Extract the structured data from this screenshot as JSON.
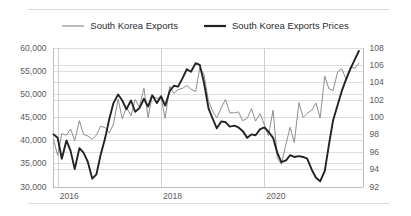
{
  "chart_data": {
    "type": "line",
    "title": "",
    "subtitle": "",
    "xlabel": "",
    "ylabel": "",
    "grid": true,
    "legend_position": "top-center",
    "x_tick_labels": [
      "2016",
      "2018",
      "2020"
    ],
    "x_tick_values": [
      2016,
      2018,
      2020
    ],
    "x_range": [
      2015.9,
      2021.9
    ],
    "axes": [
      {
        "id": "left",
        "side": "left",
        "ylim": [
          30000,
          60000
        ],
        "tick_labels": [
          "60,000",
          "55,000",
          "50,000",
          "45,000",
          "40,000",
          "35,000",
          "30,000"
        ],
        "tick_values": [
          60000,
          55000,
          50000,
          45000,
          40000,
          35000,
          30000
        ]
      },
      {
        "id": "right",
        "side": "right",
        "ylim": [
          92,
          108
        ],
        "tick_labels": [
          "108",
          "106",
          "104",
          "102",
          "100",
          "98",
          "96",
          "94",
          "92"
        ],
        "tick_values": [
          108,
          106,
          104,
          102,
          100,
          98,
          96,
          94,
          92
        ]
      }
    ],
    "series": [
      {
        "name": "South Korea Exports",
        "axis": "left",
        "color": "#8e8e8e",
        "width": 1,
        "x": [
          2015.92,
          2016.0,
          2016.08,
          2016.17,
          2016.25,
          2016.33,
          2016.42,
          2016.5,
          2016.58,
          2016.67,
          2016.75,
          2016.83,
          2016.92,
          2017.0,
          2017.08,
          2017.17,
          2017.25,
          2017.33,
          2017.42,
          2017.5,
          2017.58,
          2017.67,
          2017.75,
          2017.83,
          2017.92,
          2018.0,
          2018.08,
          2018.17,
          2018.25,
          2018.33,
          2018.42,
          2018.5,
          2018.58,
          2018.67,
          2018.75,
          2018.83,
          2018.92,
          2019.0,
          2019.08,
          2019.17,
          2019.25,
          2019.33,
          2019.42,
          2019.5,
          2019.58,
          2019.67,
          2019.75,
          2019.83,
          2019.92,
          2020.0,
          2020.08,
          2020.17,
          2020.25,
          2020.33,
          2020.42,
          2020.5,
          2020.58,
          2020.67,
          2020.75,
          2020.83,
          2020.92,
          2021.0,
          2021.08,
          2021.17,
          2021.25,
          2021.33,
          2021.42,
          2021.5,
          2021.58,
          2021.67,
          2021.75,
          2021.83
        ],
        "values": [
          40100,
          36700,
          41400,
          41100,
          42400,
          39900,
          44200,
          41300,
          40900,
          40200,
          41100,
          43000,
          42700,
          41500,
          43500,
          48900,
          44600,
          47100,
          45300,
          48800,
          47100,
          51200,
          44900,
          49600,
          49000,
          49200,
          44700,
          51600,
          50100,
          50900,
          51200,
          51800,
          51000,
          50500,
          55600,
          54300,
          48400,
          46300,
          44800,
          47100,
          48800,
          45900,
          45900,
          46100,
          44200,
          44700,
          46800,
          44100,
          45700,
          43300,
          41000,
          46500,
          36200,
          34800,
          39200,
          42800,
          39500,
          48100,
          44900,
          45800,
          46500,
          48000,
          44800,
          53800,
          51100,
          50700,
          54800,
          55400,
          53200,
          55800,
          55500,
          56600
        ]
      },
      {
        "name": "South Korea Exports Prices",
        "axis": "right",
        "color": "#232323",
        "width": 1.9,
        "x": [
          2015.92,
          2016.0,
          2016.08,
          2016.17,
          2016.25,
          2016.33,
          2016.42,
          2016.5,
          2016.58,
          2016.67,
          2016.75,
          2016.83,
          2016.92,
          2017.0,
          2017.08,
          2017.17,
          2017.25,
          2017.33,
          2017.42,
          2017.5,
          2017.58,
          2017.67,
          2017.75,
          2017.83,
          2017.92,
          2018.0,
          2018.08,
          2018.17,
          2018.25,
          2018.33,
          2018.42,
          2018.5,
          2018.58,
          2018.67,
          2018.75,
          2018.83,
          2018.92,
          2019.0,
          2019.08,
          2019.17,
          2019.25,
          2019.33,
          2019.42,
          2019.5,
          2019.58,
          2019.67,
          2019.75,
          2019.83,
          2019.92,
          2020.0,
          2020.08,
          2020.17,
          2020.25,
          2020.33,
          2020.42,
          2020.5,
          2020.58,
          2020.67,
          2020.75,
          2020.83,
          2020.92,
          2021.0,
          2021.08,
          2021.17,
          2021.25,
          2021.33,
          2021.42,
          2021.5,
          2021.58,
          2021.67,
          2021.75,
          2021.83
        ],
        "values": [
          98.0,
          97.6,
          95.2,
          97.3,
          96.1,
          94.0,
          96.4,
          95.9,
          94.9,
          92.9,
          93.4,
          95.6,
          97.6,
          99.8,
          101.6,
          102.6,
          101.9,
          100.9,
          101.9,
          100.6,
          101.0,
          102.1,
          101.2,
          102.5,
          101.6,
          102.4,
          101.3,
          103.0,
          103.6,
          103.5,
          104.5,
          105.5,
          105.2,
          106.2,
          106.0,
          104.0,
          101.0,
          99.8,
          98.7,
          99.5,
          99.4,
          98.9,
          99.0,
          98.8,
          98.4,
          97.6,
          98.0,
          97.9,
          98.6,
          98.8,
          98.3,
          97.6,
          95.9,
          94.8,
          95.0,
          95.6,
          95.4,
          95.5,
          95.4,
          95.2,
          93.9,
          93.0,
          92.6,
          93.8,
          96.8,
          99.6,
          101.4,
          103.0,
          104.3,
          105.6,
          106.6,
          107.6
        ]
      }
    ]
  },
  "legend": {
    "items": [
      {
        "label": "South Korea Exports",
        "color": "#8e8e8e"
      },
      {
        "label": "South Korea Exports Prices",
        "color": "#232323"
      }
    ]
  }
}
